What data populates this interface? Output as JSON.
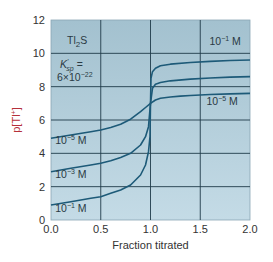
{
  "chart_data": {
    "type": "line",
    "title": "",
    "xlabel": "Fraction titrated",
    "ylabel": "p[Tl+]",
    "ylabel_parts": {
      "base": "p[Tl",
      "sup": "+",
      "end": "]"
    },
    "xlim": [
      0.0,
      2.0
    ],
    "ylim": [
      0,
      12
    ],
    "xticks": [
      "0.0",
      "0.5",
      "1.0",
      "1.5",
      "2.0"
    ],
    "xtick_values": [
      0.0,
      0.5,
      1.0,
      1.5,
      2.0
    ],
    "yticks": [
      "0",
      "2",
      "4",
      "6",
      "8",
      "10",
      "12"
    ],
    "ytick_values": [
      0,
      2,
      4,
      6,
      8,
      10,
      12
    ],
    "grid": true,
    "legend": "inline labels",
    "annotation": {
      "compound": "Tl2S",
      "compound_parts": {
        "a": "Tl",
        "sub": "2",
        "b": "S"
      },
      "ksp_label": "K'sp =",
      "ksp_parts": {
        "k": "K",
        "sup": "'",
        "sub": "sp",
        "eq": " ="
      },
      "ksp_value": "6×10^-22",
      "ksp_value_parts": {
        "base": "6×10",
        "exp": "−22"
      }
    },
    "series": [
      {
        "name": "10^-1 M",
        "label_parts": {
          "base": "10",
          "exp": "−1",
          "unit": " M"
        },
        "x": [
          0.0,
          0.2,
          0.4,
          0.5,
          0.6,
          0.7,
          0.8,
          0.9,
          0.95,
          0.98,
          0.995,
          1.0,
          1.005,
          1.02,
          1.05,
          1.1,
          1.2,
          1.4,
          1.6,
          1.8,
          2.0
        ],
        "y": [
          0.9,
          1.1,
          1.3,
          1.4,
          1.6,
          1.8,
          2.1,
          2.7,
          3.3,
          4.1,
          5.0,
          7.0,
          8.5,
          8.9,
          9.1,
          9.25,
          9.35,
          9.45,
          9.52,
          9.57,
          9.6
        ]
      },
      {
        "name": "10^-3 M",
        "label_parts": {
          "base": "10",
          "exp": "−3",
          "unit": " M"
        },
        "x": [
          0.0,
          0.2,
          0.4,
          0.5,
          0.6,
          0.7,
          0.8,
          0.9,
          0.95,
          0.98,
          1.0,
          1.02,
          1.05,
          1.1,
          1.2,
          1.4,
          1.6,
          1.8,
          2.0
        ],
        "y": [
          2.9,
          3.1,
          3.3,
          3.4,
          3.55,
          3.75,
          4.0,
          4.5,
          5.0,
          5.6,
          7.0,
          7.9,
          8.15,
          8.25,
          8.35,
          8.45,
          8.52,
          8.57,
          8.6
        ]
      },
      {
        "name": "10^-5 M",
        "label_parts": {
          "base": "10",
          "exp": "−5",
          "unit": " M"
        },
        "x": [
          0.0,
          0.2,
          0.4,
          0.5,
          0.6,
          0.7,
          0.8,
          0.9,
          0.95,
          1.0,
          1.05,
          1.1,
          1.2,
          1.3,
          1.4,
          1.6,
          1.8,
          2.0
        ],
        "y": [
          4.9,
          5.1,
          5.3,
          5.4,
          5.55,
          5.75,
          6.05,
          6.5,
          6.75,
          7.0,
          7.2,
          7.3,
          7.38,
          7.43,
          7.47,
          7.53,
          7.57,
          7.6
        ]
      }
    ],
    "inline_labels": [
      {
        "series": "10^-1 M",
        "x": 1.75,
        "y": 10.5,
        "parts": {
          "base": "10",
          "exp": "−1",
          "unit": " M"
        }
      },
      {
        "series": "10^-5 M",
        "x": 1.72,
        "y": 6.9,
        "parts": {
          "base": "10",
          "exp": "−5",
          "unit": " M"
        }
      },
      {
        "series": "10^-5 M",
        "x": 0.2,
        "y": 4.55,
        "parts": {
          "base": "10",
          "exp": "−5",
          "unit": " M"
        }
      },
      {
        "series": "10^-3 M",
        "x": 0.2,
        "y": 2.55,
        "parts": {
          "base": "10",
          "exp": "−3",
          "unit": " M"
        }
      },
      {
        "series": "10^-1 M",
        "x": 0.2,
        "y": 0.5,
        "parts": {
          "base": "10",
          "exp": "−1",
          "unit": " M"
        }
      }
    ]
  },
  "colors": {
    "plot_bg": "#a9c6d4",
    "plot_bg_light": "#c6dce6",
    "grid": "#1f3b4a",
    "curve": "#1d5a78",
    "axis_label_red": "#b5303a",
    "text": "#333333"
  }
}
